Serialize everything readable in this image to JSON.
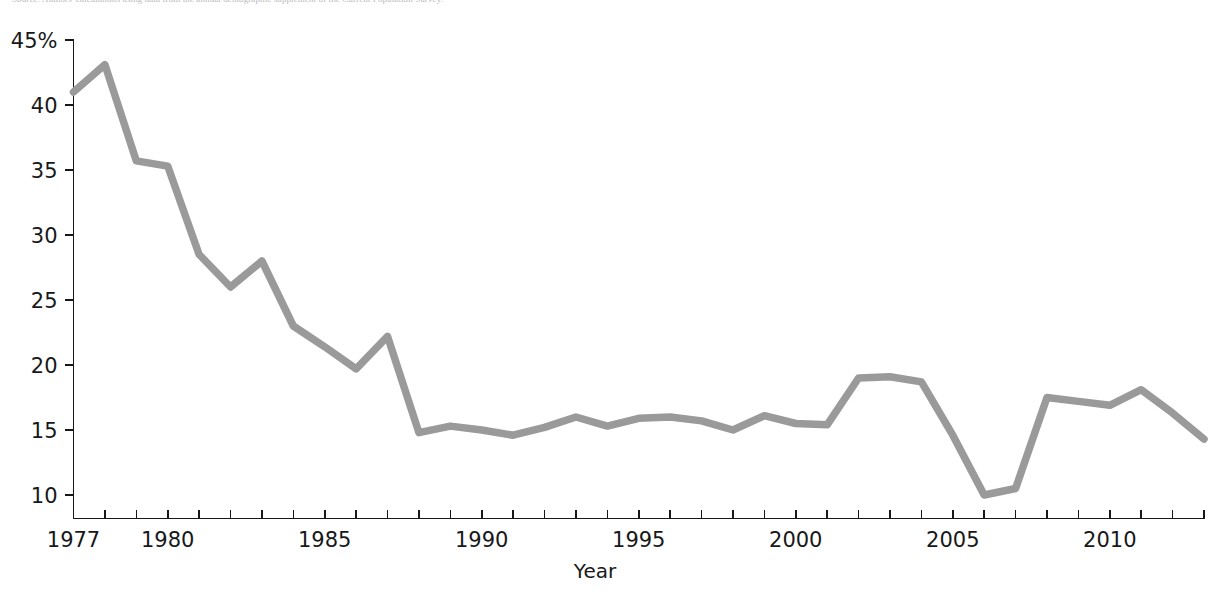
{
  "figure": {
    "source_note": "Source: Authors' calculations using data from the annual demographic supplement of the Current Population Survey.",
    "background_color": "#ffffff",
    "line_color": "#9a9a9a",
    "axis_color": "#17181a"
  },
  "chart_data": {
    "type": "line",
    "title": "",
    "subtitle": "",
    "xlabel": "Year",
    "ylabel": "",
    "xlim": [
      1977,
      2013
    ],
    "ylim": [
      9,
      45
    ],
    "grid": false,
    "legend": null,
    "x_tick_labels": [
      "1977",
      "1980",
      "1985",
      "1990",
      "1995",
      "2000",
      "2005",
      "2010"
    ],
    "x_tick_values": [
      1977,
      1980,
      1985,
      1990,
      1995,
      2000,
      2005,
      2010
    ],
    "x_minor_tick_interval": 1,
    "y_tick_labels": [
      "10",
      "15",
      "20",
      "25",
      "30",
      "35",
      "40",
      "45%"
    ],
    "y_tick_values": [
      10,
      15,
      20,
      25,
      30,
      35,
      40,
      45
    ],
    "series": [
      {
        "name": "Share",
        "color": "#9a9a9a",
        "x": [
          1977,
          1978,
          1979,
          1980,
          1981,
          1982,
          1983,
          1984,
          1985,
          1986,
          1987,
          1988,
          1989,
          1990,
          1991,
          1992,
          1993,
          1994,
          1995,
          1996,
          1997,
          1998,
          1999,
          2000,
          2001,
          2002,
          2003,
          2004,
          2005,
          2006,
          2007,
          2008,
          2009,
          2010,
          2011,
          2012,
          2013
        ],
        "values": [
          41.0,
          43.1,
          35.7,
          35.3,
          28.5,
          26.0,
          28.0,
          23.0,
          21.4,
          19.7,
          22.2,
          14.8,
          15.3,
          15.0,
          14.6,
          15.2,
          16.0,
          15.3,
          15.9,
          16.0,
          15.7,
          15.0,
          16.1,
          15.5,
          15.4,
          19.0,
          19.1,
          18.7,
          14.6,
          10.0,
          10.5,
          17.5,
          17.2,
          16.9,
          18.1,
          16.3,
          14.3
        ]
      }
    ]
  }
}
